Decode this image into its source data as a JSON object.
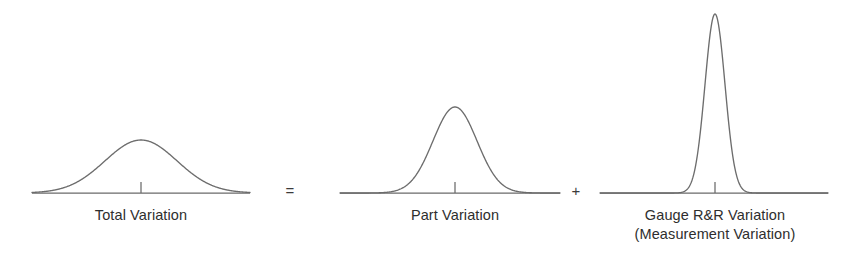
{
  "figure": {
    "type": "diagram",
    "background_color": "#ffffff",
    "curve_color": "#6d6d6d",
    "axis_color": "#6a6a6a",
    "text_color": "#2e2e2e"
  },
  "equation": {
    "equals_symbol": "=",
    "plus_symbol": "+"
  },
  "distributions": [
    {
      "id": "total-variation",
      "label": "Total Variation",
      "label_line2": "",
      "relative_spread": "wide",
      "relative_height": "low",
      "peak_height_px": 53,
      "sigma_px": 36,
      "axis_left_px": 32,
      "axis_right_px": 250,
      "center_px": 141,
      "baseline_px": 193
    },
    {
      "id": "part-variation",
      "label": "Part Variation",
      "label_line2": "",
      "relative_spread": "medium",
      "relative_height": "medium",
      "peak_height_px": 86,
      "sigma_px": 22,
      "axis_left_px": 340,
      "axis_right_px": 560,
      "center_px": 455,
      "baseline_px": 193
    },
    {
      "id": "gauge-rr-variation",
      "label": "Gauge R&R Variation",
      "label_line2": "(Measurement Variation)",
      "relative_spread": "narrow",
      "relative_height": "tall",
      "peak_height_px": 179,
      "sigma_px": 10,
      "axis_left_px": 600,
      "axis_right_px": 828,
      "center_px": 715,
      "baseline_px": 193
    }
  ],
  "chart_data": {
    "type": "line",
    "title": "",
    "xlabel": "",
    "ylabel": "",
    "grid": false,
    "legend": "none",
    "series": [
      {
        "name": "Total Variation",
        "distribution": "normal",
        "mean": 0,
        "sigma": 36,
        "peak": 53
      },
      {
        "name": "Part Variation",
        "distribution": "normal",
        "mean": 0,
        "sigma": 22,
        "peak": 86
      },
      {
        "name": "Gauge R&R Variation",
        "distribution": "normal",
        "mean": 0,
        "sigma": 10,
        "peak": 179
      }
    ],
    "annotations": [
      "Total Variation = Part Variation + Gauge R&R Variation"
    ]
  }
}
